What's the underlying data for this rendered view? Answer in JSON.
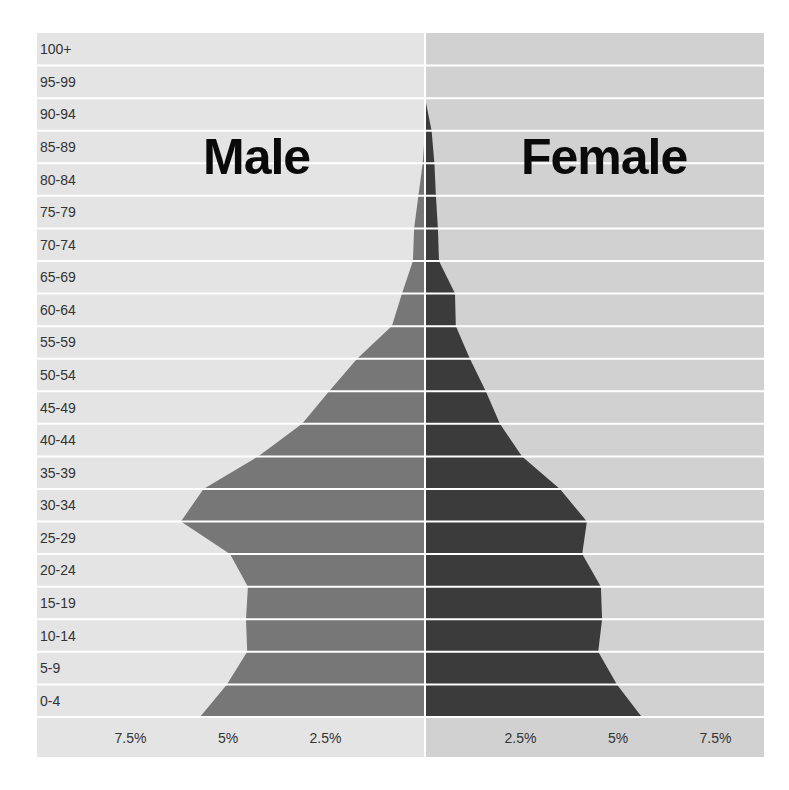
{
  "chart_data": {
    "type": "bar",
    "subtype": "population-pyramid",
    "title": "",
    "xlabel": "",
    "ylabel": "",
    "categories": [
      "100+",
      "95-99",
      "90-94",
      "85-89",
      "80-84",
      "75-79",
      "70-74",
      "65-69",
      "60-64",
      "55-59",
      "50-54",
      "45-49",
      "40-44",
      "35-39",
      "30-34",
      "25-29",
      "20-24",
      "15-19",
      "10-14",
      "5-9",
      "0-4"
    ],
    "series": [
      {
        "name": "Male",
        "side": "left",
        "color": "#777777",
        "values": [
          0,
          0,
          0.0,
          0.03,
          0.1,
          0.2,
          0.3,
          0.45,
          0.7,
          1.3,
          2.1,
          2.8,
          3.7,
          5.0,
          6.0,
          5.6,
          4.8,
          4.6,
          4.6,
          4.8,
          5.4
        ]
      },
      {
        "name": "Female",
        "side": "right",
        "color": "#3b3b3b",
        "values": [
          0,
          0,
          0.1,
          0.2,
          0.26,
          0.3,
          0.35,
          0.55,
          0.78,
          1.0,
          1.35,
          1.75,
          2.2,
          3.0,
          3.8,
          4.1,
          4.3,
          4.5,
          4.5,
          4.7,
          5.2
        ]
      }
    ],
    "outline": {
      "note_boundaries": "percent width at each row boundary, top of 90-94 row down to bottom of 0-4 row",
      "male": [
        0,
        0.0,
        0.06,
        0.17,
        0.28,
        0.31,
        0.59,
        0.85,
        1.74,
        2.46,
        3.15,
        4.28,
        5.68,
        6.26,
        5.0,
        4.54,
        4.59,
        4.56,
        5.08,
        5.77
      ],
      "female": [
        0,
        0.17,
        0.24,
        0.28,
        0.33,
        0.36,
        0.77,
        0.79,
        1.15,
        1.56,
        1.92,
        2.49,
        3.46,
        4.15,
        4.03,
        4.51,
        4.54,
        4.44,
        4.92,
        5.56
      ]
    },
    "x_ticks": {
      "left": [
        "7.5%",
        "5%",
        "2.5%"
      ],
      "left_values": [
        7.5,
        5,
        2.5
      ],
      "right": [
        "2.5%",
        "5%",
        "7.5%"
      ],
      "right_values": [
        2.5,
        5,
        7.5
      ]
    },
    "xlim": [
      -8.7,
      8.7
    ],
    "grid": true,
    "legend": {
      "male_label": "Male",
      "female_label": "Female",
      "position": "inside-top"
    },
    "colors": {
      "left_background": "#e4e4e4",
      "right_background": "#d1d1d1",
      "gridline": "#ffffff",
      "male_fill": "#777777",
      "female_fill": "#3b3b3b"
    }
  }
}
